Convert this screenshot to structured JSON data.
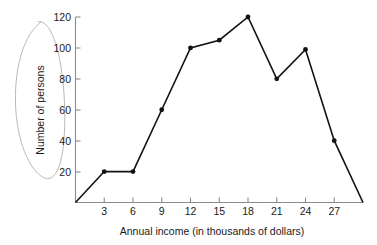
{
  "chart_data": {
    "type": "line",
    "title": "",
    "subtitle": "",
    "xlabel": "Annual income (in thousands of dollars)",
    "ylabel": "Number of persons",
    "x": [
      0,
      3,
      6,
      9,
      12,
      15,
      18,
      21,
      24,
      27,
      30
    ],
    "values": [
      0,
      20,
      20,
      60,
      100,
      105,
      120,
      80,
      99,
      40,
      0
    ],
    "series": [
      {
        "name": "Number of persons",
        "values": [
          0,
          20,
          20,
          60,
          100,
          105,
          120,
          80,
          99,
          40,
          0
        ]
      }
    ],
    "xtick_labels": [
      "3",
      "6",
      "9",
      "12",
      "15",
      "18",
      "21",
      "24",
      "27"
    ],
    "xtick_values": [
      3,
      6,
      9,
      12,
      15,
      18,
      21,
      24,
      27
    ],
    "ytick_labels": [
      "20",
      "40",
      "60",
      "80",
      "100",
      "120"
    ],
    "ytick_values": [
      20,
      40,
      60,
      80,
      100,
      120
    ],
    "xlim": [
      0,
      30
    ],
    "ylim": [
      0,
      120
    ],
    "grid": false,
    "legend": "none",
    "marker": "filled-circle",
    "line_color": "#121212",
    "marker_color": "#121212",
    "axis_color": "#8c8c8c",
    "text_color": "#1a1a1a",
    "background_color": "#ffffff",
    "annotations": [
      {
        "name": "hand-drawn-oval-around-y-axis-label",
        "shape": "ellipse",
        "color": "#b9b9b9",
        "target": "Number of persons"
      }
    ]
  },
  "axis": {
    "y_title": "Number of persons",
    "x_title": "Annual income (in thousands of dollars)",
    "y_ticks": [
      "120",
      "100",
      "80",
      "60",
      "40",
      "20"
    ],
    "x_ticks": [
      "3",
      "6",
      "9",
      "12",
      "15",
      "18",
      "21",
      "24",
      "27"
    ]
  }
}
